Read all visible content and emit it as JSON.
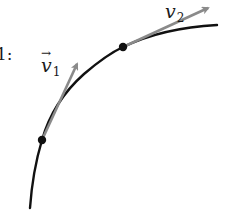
{
  "diagram": {
    "partial_label": "1:",
    "vectors": [
      {
        "label": "v",
        "subscript": "1",
        "has_vector_arrow": true,
        "color": "#8a8a8a"
      },
      {
        "label": "v",
        "subscript": "2",
        "has_vector_arrow": false,
        "color": "#8a8a8a"
      }
    ],
    "curve_color": "#111111",
    "point_color": "#111111",
    "vector_arrow_glyph": "→"
  }
}
